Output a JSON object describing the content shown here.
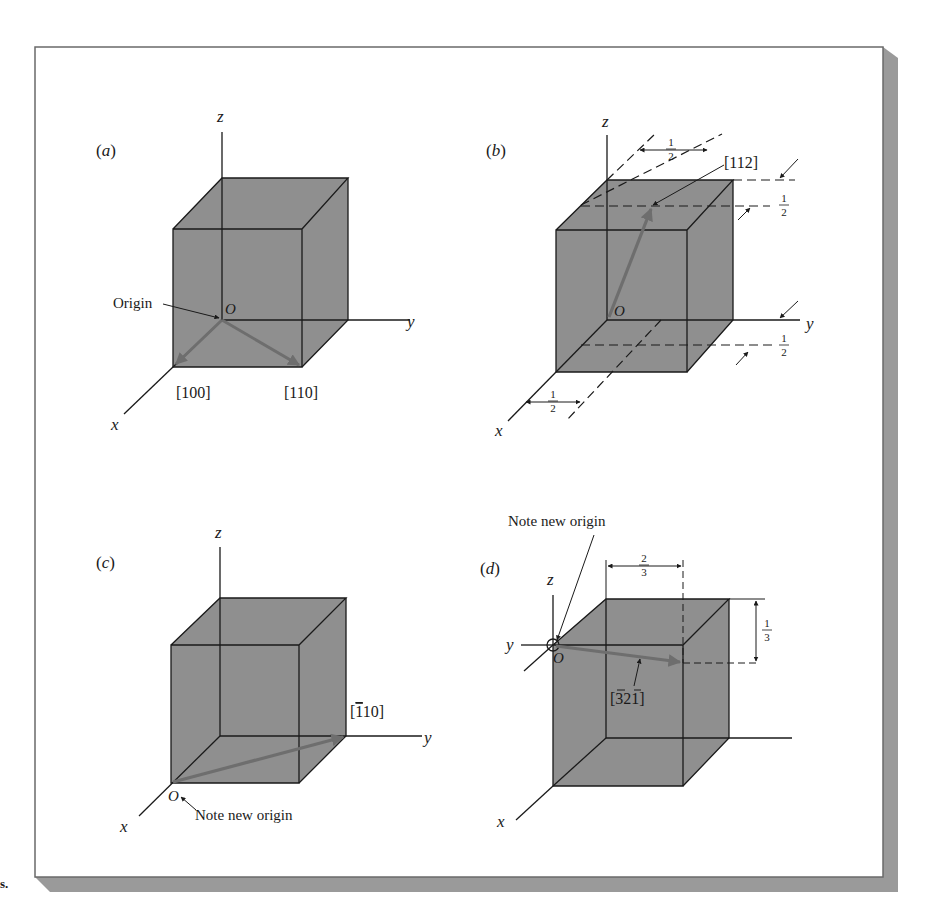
{
  "figure": {
    "colors": {
      "cube_fill": "#8f8f8f",
      "cube_edge": "#1a1a1a",
      "vector": "#6e6e6e",
      "frame_border": "#6a6a6a",
      "frame_shadow": "#999999",
      "background": "#ffffff"
    },
    "stray_mark": "s."
  },
  "panels": {
    "a": {
      "label": "(a)",
      "axes": {
        "x": "x",
        "y": "y",
        "z": "z"
      },
      "origin_label": "O",
      "callout": "Origin",
      "vectors": [
        {
          "label": "[100]"
        },
        {
          "label": "[110]"
        }
      ]
    },
    "b": {
      "label": "(b)",
      "axes": {
        "x": "x",
        "y": "y",
        "z": "z"
      },
      "origin_label": "O",
      "vectors": [
        {
          "label": "[112]"
        }
      ],
      "dimensions": {
        "top_half_num": "1",
        "top_half_den": "2",
        "right_upper_num": "1",
        "right_upper_den": "2",
        "right_lower_num": "1",
        "right_lower_den": "2",
        "bottom_half_num": "1",
        "bottom_half_den": "2"
      }
    },
    "c": {
      "label": "(c)",
      "axes": {
        "x": "x",
        "y": "y",
        "z": "z"
      },
      "origin_label": "O",
      "callout": "Note new origin",
      "vectors": [
        {
          "label_bar": "1",
          "label_rest": "10]",
          "label_open": "["
        }
      ]
    },
    "d": {
      "label": "(d)",
      "axes": {
        "x": "x",
        "y": "y",
        "z": "z"
      },
      "origin_label": "O",
      "callout": "Note new origin",
      "vectors": [
        {
          "label_open": "[",
          "label_bar1": "3",
          "label_mid": "2",
          "label_bar2": "1",
          "label_close": "]"
        }
      ],
      "dimensions": {
        "top_num": "2",
        "top_den": "3",
        "right_num": "1",
        "right_den": "3"
      }
    }
  }
}
